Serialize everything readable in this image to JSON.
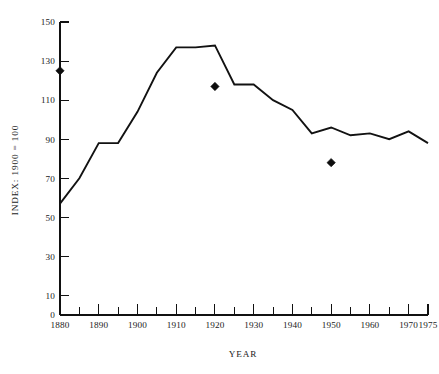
{
  "chart_data": {
    "type": "line",
    "title": "",
    "xlabel": "YEAR",
    "ylabel": "INDEX: 1900 = 100",
    "xlim": [
      1880,
      1975
    ],
    "ylim": [
      0,
      150
    ],
    "grid": false,
    "legend": "none",
    "y_ticks": [
      0,
      10,
      30,
      50,
      70,
      90,
      110,
      130,
      150
    ],
    "y_tick_labels": [
      "0",
      "10",
      "30",
      "50",
      "70",
      "90",
      "110",
      "130",
      "150"
    ],
    "x_ticks": [
      1880,
      1890,
      1900,
      1910,
      1920,
      1930,
      1940,
      1950,
      1960,
      1970,
      1975
    ],
    "x_tick_labels": [
      "1880",
      "1890",
      "1900",
      "1910",
      "1920",
      "1930",
      "1940",
      "1950",
      "1960",
      "1970",
      "1975"
    ],
    "x_minor_ticks": [
      1885,
      1895,
      1905,
      1915,
      1925,
      1935,
      1945,
      1955,
      1965
    ],
    "series": [
      {
        "name": "index-line",
        "kind": "line",
        "x": [
          1880,
          1885,
          1890,
          1895,
          1900,
          1905,
          1910,
          1915,
          1920,
          1925,
          1930,
          1935,
          1940,
          1945,
          1950,
          1955,
          1960,
          1965,
          1970,
          1975
        ],
        "values": [
          57,
          70,
          88,
          88,
          104,
          124,
          137,
          137,
          138,
          118,
          118,
          110,
          105,
          93,
          96,
          92,
          93,
          90,
          94,
          88
        ]
      },
      {
        "name": "benchmark-points",
        "kind": "scatter",
        "marker": "diamond",
        "x": [
          1880,
          1920,
          1950
        ],
        "values": [
          125,
          117,
          78
        ]
      }
    ]
  },
  "axes": {
    "y_axis_title": "INDEX: 1900 = 100",
    "x_axis_title": "YEAR"
  }
}
